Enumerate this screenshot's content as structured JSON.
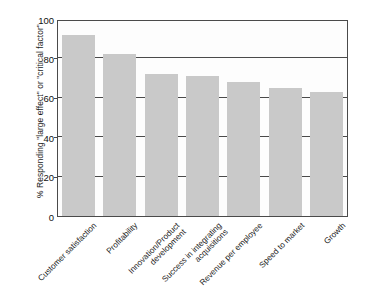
{
  "chart_data": {
    "type": "bar",
    "title": "",
    "subtitle": "",
    "xlabel": "",
    "ylabel": "% Responding \"large effect\" or \"critical factor\"",
    "categories": [
      "Customer satisfaction",
      "Profitability",
      "Innovation/Product\ndevelopment",
      "Success in integrating\nacquisitions",
      "Revenue per employee",
      "Speed to market",
      "Growth"
    ],
    "values": [
      92,
      82,
      72,
      71,
      68,
      65,
      63
    ],
    "ylim": [
      0,
      100
    ],
    "yticks": [
      0,
      20,
      40,
      60,
      80,
      100
    ],
    "ytick_labels": [
      "0",
      "20",
      "40",
      "60",
      "80",
      "100"
    ],
    "grid": "horizontal",
    "legend": "none",
    "bar_color": "#c9c9c9",
    "axis_color": "#4a4a4a",
    "plot_background": "#fdfdfd"
  }
}
